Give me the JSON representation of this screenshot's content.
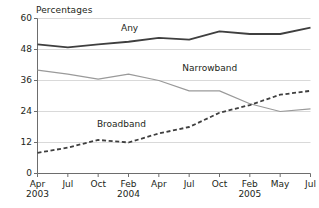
{
  "chart_data": {
    "type": "line",
    "title": "",
    "subtitle": "",
    "xlabel": "",
    "ylabel": "Percentages",
    "ylim": [
      0,
      60
    ],
    "yticks": [
      0,
      12,
      24,
      36,
      48,
      60
    ],
    "grid": "horizontal",
    "legend": "inline-labels",
    "categories": [
      "Apr 2003",
      "Jul 2003",
      "Oct 2003",
      "Feb 2004",
      "Apr 2004",
      "Jul 2004",
      "Oct 2004",
      "Feb 2005",
      "May 2005",
      "Jul 2005"
    ],
    "xtick_labels": [
      "Apr",
      "Jul",
      "Oct",
      "Feb",
      "Apr",
      "Jul",
      "Oct",
      "Feb",
      "May",
      "Jul"
    ],
    "xtick_years": [
      "2003",
      "",
      "",
      "2004",
      "",
      "",
      "",
      "2005",
      "",
      ""
    ],
    "series": [
      {
        "name": "Any",
        "style": "solid",
        "color": "#3f3f3f",
        "width": 1.8,
        "values": [
          50.0,
          48.8,
          50.0,
          51.0,
          52.5,
          51.8,
          55.0,
          54.0,
          54.0,
          56.5
        ]
      },
      {
        "name": "Narrowband",
        "style": "solid",
        "color": "#9a9a9a",
        "width": 1.2,
        "values": [
          40.0,
          38.5,
          36.5,
          38.5,
          36.0,
          32.0,
          32.0,
          27.0,
          24.0,
          25.0
        ]
      },
      {
        "name": "Broadband",
        "style": "dashed",
        "color": "#3f3f3f",
        "width": 1.8,
        "values": [
          8.0,
          10.0,
          13.0,
          12.0,
          15.5,
          18.0,
          23.5,
          26.5,
          30.5,
          32.0
        ]
      }
    ],
    "annotations": [
      {
        "text": "Any",
        "x": 3.0,
        "y": 56.5
      },
      {
        "text": "Narrowband",
        "x": 5.6,
        "y": 41.0
      },
      {
        "text": "Broadband",
        "x": 2.7,
        "y": 19.0
      }
    ],
    "colors": {
      "axis": "#6d6d6d",
      "gridline": "#d9d9d9",
      "text": "#231f20",
      "background": "#ffffff"
    }
  }
}
